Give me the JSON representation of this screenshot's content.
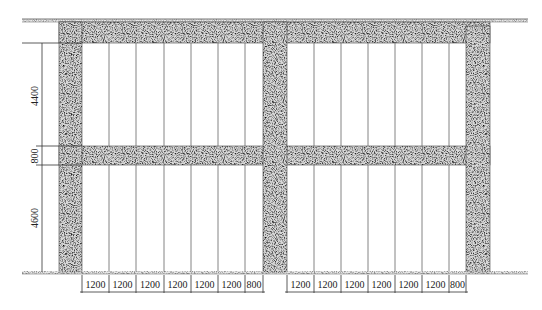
{
  "drawing": {
    "title": "Wall elevation with panel divisions",
    "colors": {
      "line": "#333333",
      "concrete_fill": "#bdbdbd",
      "background": "#ffffff"
    },
    "vertical_dimensions": [
      {
        "label": "4400",
        "y1": 43,
        "y2": 146
      },
      {
        "label": "800",
        "y1": 146,
        "y2": 165
      },
      {
        "label": "4600",
        "y1": 165,
        "y2": 272
      }
    ],
    "bays": [
      {
        "name": "left-bay",
        "panel_widths": [
          "1200",
          "1200",
          "1200",
          "1200",
          "1200",
          "1200",
          "800"
        ]
      },
      {
        "name": "right-bay",
        "panel_widths": [
          "1200",
          "1200",
          "1200",
          "1200",
          "1200",
          "1200",
          "800"
        ]
      }
    ]
  }
}
